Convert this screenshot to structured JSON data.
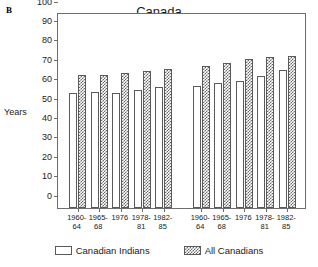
{
  "panel_letter": "B",
  "y_axis_title": "Years",
  "legend": {
    "items": [
      {
        "label": "Canadian Indians",
        "pattern": "plain",
        "color": "#ffffff"
      },
      {
        "label": "All Canadians",
        "pattern": "checker",
        "color": "#6a6a6a"
      }
    ]
  },
  "chart_data": {
    "type": "bar",
    "title": "Canada",
    "xlabel": "",
    "ylabel": "Years",
    "ylim": [
      0,
      100
    ],
    "yticks": [
      0,
      10,
      20,
      30,
      40,
      50,
      60,
      70,
      80,
      90,
      100
    ],
    "ytick_labels": [
      "0",
      "10",
      "20",
      "30",
      "40",
      "50",
      "60",
      "70",
      "80",
      "90",
      "100"
    ],
    "grid": false,
    "legend_position": "bottom",
    "groups": [
      {
        "name": "Male",
        "categories": [
          "1960-64",
          "1965-68",
          "1976",
          "1978-81",
          "1982-85"
        ],
        "category_lines": [
          [
            "1960-",
            "64"
          ],
          [
            "1965-",
            "68"
          ],
          [
            "1976",
            ""
          ],
          [
            "1978-",
            "81"
          ],
          [
            "1982-",
            "85"
          ]
        ],
        "series": [
          {
            "name": "Canadian Indians",
            "values": [
              59.5,
              60.0,
              59.5,
              61.0,
              62.5
            ]
          },
          {
            "name": "All Canadians",
            "values": [
              68.5,
              68.5,
              69.5,
              70.5,
              71.5
            ]
          }
        ]
      },
      {
        "name": "Female",
        "categories": [
          "1960-64",
          "1965-68",
          "1976",
          "1978-81",
          "1982-85"
        ],
        "category_lines": [
          [
            "1960-",
            "64"
          ],
          [
            "1965-",
            "68"
          ],
          [
            "1976",
            ""
          ],
          [
            "1978-",
            "81"
          ],
          [
            "1982-",
            "85"
          ]
        ],
        "series": [
          {
            "name": "Canadian Indians",
            "values": [
              63.0,
              64.5,
              65.5,
              68.0,
              71.0
            ]
          },
          {
            "name": "All Canadians",
            "values": [
              73.0,
              74.5,
              77.0,
              78.0,
              78.5
            ]
          }
        ]
      }
    ]
  }
}
